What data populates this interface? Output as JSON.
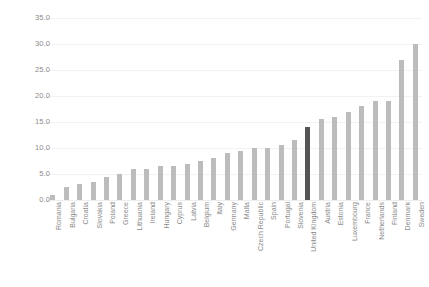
{
  "chart_data": {
    "type": "bar",
    "title": "",
    "subtitle": "",
    "xlabel": "",
    "ylabel": "",
    "ylim": [
      0.0,
      35.0
    ],
    "ytick_step": 5.0,
    "yticks": [
      "0.0",
      "5.0",
      "10.0",
      "15.0",
      "20.0",
      "25.0",
      "30.0",
      "35.0"
    ],
    "grid": true,
    "legend": "none",
    "bar_color": "#bcbcbc",
    "highlight_color": "#555555",
    "highlight_category": "United Kingdom",
    "categories": [
      "Romania",
      "Bulgaria",
      "Croatia",
      "Slovakia",
      "Poland",
      "Greece",
      "Lithuania",
      "Ireland",
      "Hungary",
      "Cyprus",
      "Latvia",
      "Belgium",
      "Italy",
      "Germany",
      "Malta",
      "Czech Republic",
      "Spain",
      "Portugal",
      "Slovenia",
      "United Kingdom",
      "Austria",
      "Estonia",
      "Luxembourg",
      "France",
      "Netherlands",
      "Finland",
      "Denmark",
      "Sweden"
    ],
    "values": [
      1.0,
      2.5,
      3.0,
      3.5,
      4.5,
      5.0,
      6.0,
      6.0,
      6.5,
      6.5,
      7.0,
      7.5,
      8.0,
      9.0,
      9.5,
      10.0,
      10.0,
      10.5,
      11.5,
      14.0,
      15.5,
      16.0,
      17.0,
      18.0,
      19.0,
      19.0,
      27.0,
      30.0
    ]
  }
}
